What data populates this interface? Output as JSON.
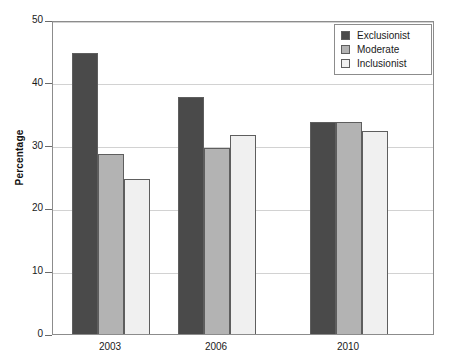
{
  "chart_data": {
    "type": "bar",
    "title": "",
    "xlabel": "",
    "ylabel": "Percentage",
    "categories": [
      "2003",
      "2006",
      "2010"
    ],
    "series": [
      {
        "name": "Exclusionist",
        "color": "#4a4a4a",
        "values": [
          45,
          38,
          34
        ]
      },
      {
        "name": "Moderate",
        "color": "#b3b3b3",
        "values": [
          29,
          30,
          34
        ]
      },
      {
        "name": "Inclusionist",
        "color": "#f0f0f0",
        "values": [
          25,
          32,
          32.7
        ]
      }
    ],
    "ylim": [
      0,
      50
    ],
    "yticks": [
      0,
      10,
      20,
      30,
      40,
      50
    ],
    "ytick_labels": [
      "0",
      "10",
      "20",
      "30",
      "40",
      "50"
    ],
    "grid": true,
    "legend_position": "top-right"
  },
  "legend": {
    "items": [
      {
        "label": "Exclusionist"
      },
      {
        "label": "Moderate"
      },
      {
        "label": "Inclusionist"
      }
    ]
  },
  "axes": {
    "y_title": "Percentage"
  }
}
